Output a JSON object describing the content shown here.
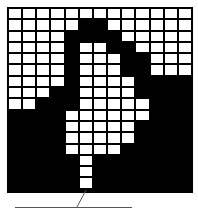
{
  "figure": {
    "type": "binary-pixel-grid",
    "columns": 13,
    "rows": 16,
    "colors": {
      "on": "#ffffff",
      "off": "#000000",
      "leader_line": "#555555"
    },
    "grid": [
      "1111111111111",
      "1111100111111",
      "1111000011111",
      "1111011001111",
      "1111011100111",
      "1111011100111",
      "1111011110000",
      "1110011110000",
      "1100011111000",
      "0000111111000",
      "0000111110000",
      "0000111110000",
      "0000111100000",
      "0000010000000",
      "0000010000000",
      "0000010000000"
    ],
    "callout": {
      "label": ""
    }
  }
}
